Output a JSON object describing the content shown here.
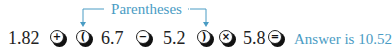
{
  "annotation": {
    "label": "Parentheses",
    "color": "#4a9cc4"
  },
  "expression": {
    "tokens": [
      {
        "type": "number",
        "value": "1.82"
      },
      {
        "type": "key",
        "name": "plus-key",
        "symbol": "+"
      },
      {
        "type": "key",
        "name": "open-paren-key",
        "symbol": "("
      },
      {
        "type": "number",
        "value": "6.7"
      },
      {
        "type": "key",
        "name": "minus-key",
        "symbol": "−"
      },
      {
        "type": "number",
        "value": "5.2"
      },
      {
        "type": "key",
        "name": "close-paren-key",
        "symbol": ")"
      },
      {
        "type": "key",
        "name": "multiply-key",
        "symbol": "×"
      },
      {
        "type": "number",
        "value": "5.8"
      },
      {
        "type": "key",
        "name": "equals-key",
        "symbol": "="
      }
    ]
  },
  "result": {
    "text": "Answer is 10.52",
    "color": "#4a9cc4"
  }
}
